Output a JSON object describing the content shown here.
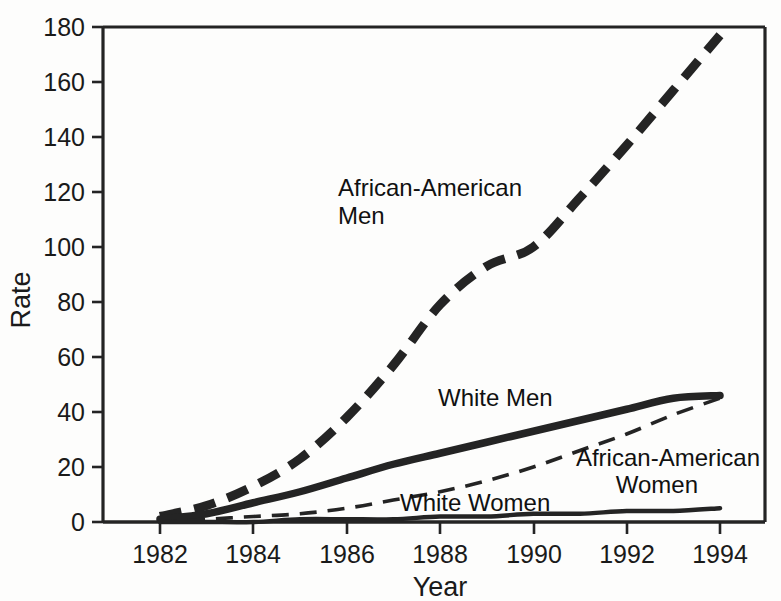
{
  "chart_data": {
    "type": "line",
    "title": "",
    "xlabel": "Year",
    "ylabel": "Rate",
    "xlim": [
      1981,
      1994.95
    ],
    "ylim": [
      0,
      180
    ],
    "grid": false,
    "legend_position": "inline-annotations",
    "x_ticks": [
      "1982",
      "1984",
      "1986",
      "1988",
      "1990",
      "1992",
      "1994"
    ],
    "y_ticks": [
      "0",
      "20",
      "40",
      "60",
      "80",
      "100",
      "120",
      "140",
      "160",
      "180"
    ],
    "x": [
      1982,
      1983,
      1984,
      1985,
      1986,
      1987,
      1988,
      1989,
      1990,
      1991,
      1992,
      1993,
      1994
    ],
    "series": [
      {
        "name": "African-American Men",
        "style": "thick-dashed",
        "color": "#242424",
        "values": [
          2,
          6,
          13,
          23,
          38,
          57,
          79,
          93,
          100,
          118,
          137,
          157,
          177
        ]
      },
      {
        "name": "White Men",
        "style": "thick-solid",
        "color": "#242424",
        "values": [
          1,
          3,
          7,
          11,
          16,
          21,
          25,
          29,
          33,
          37,
          41,
          45,
          46
        ]
      },
      {
        "name": "African-American Women",
        "style": "thin-dashed",
        "color": "#242424",
        "values": [
          0,
          1,
          2,
          3,
          5,
          8,
          11,
          15,
          20,
          26,
          32,
          39,
          45
        ]
      },
      {
        "name": "White Women",
        "style": "thin-solid",
        "color": "#242424",
        "values": [
          0,
          0,
          0,
          1,
          1,
          1,
          2,
          2,
          3,
          3,
          4,
          4,
          5
        ]
      }
    ],
    "annotations": [
      {
        "id": "african-american-men",
        "line1": "African-American",
        "line2": "Men"
      },
      {
        "id": "white-men",
        "line1": "White Men",
        "line2": ""
      },
      {
        "id": "african-american-women",
        "line1": "African-American",
        "line2": "Women"
      },
      {
        "id": "white-women",
        "line1": "White Women",
        "line2": ""
      }
    ]
  },
  "axis": {
    "y_title": "Rate",
    "x_title": "Year",
    "y_tick_0": "0",
    "y_tick_20": "20",
    "y_tick_40": "40",
    "y_tick_60": "60",
    "y_tick_80": "80",
    "y_tick_100": "100",
    "y_tick_120": "120",
    "y_tick_140": "140",
    "y_tick_160": "160",
    "y_tick_180": "180",
    "x_tick_1982": "1982",
    "x_tick_1984": "1984",
    "x_tick_1986": "1986",
    "x_tick_1988": "1988",
    "x_tick_1990": "1990",
    "x_tick_1992": "1992",
    "x_tick_1994": "1994"
  },
  "labels": {
    "aa_men_l1": "African-American",
    "aa_men_l2": "Men",
    "white_men": "White Men",
    "aa_women_l1": "African-American",
    "aa_women_l2": "Women",
    "white_women": "White Women"
  },
  "colors": {
    "ink": "#242424",
    "background": "#fdfdfc"
  }
}
